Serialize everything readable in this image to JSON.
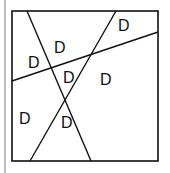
{
  "diagram": {
    "box": {
      "x1": 12,
      "y1": 11,
      "x2": 158,
      "y2": 161
    },
    "lines": [
      {
        "name": "line-a",
        "x1": 27,
        "y1": 11,
        "x2": 91,
        "y2": 161
      },
      {
        "name": "line-b",
        "x1": 116,
        "y1": 11,
        "x2": 30,
        "y2": 161
      },
      {
        "name": "line-c",
        "x1": 12,
        "y1": 81,
        "x2": 158,
        "y2": 32
      }
    ],
    "labels": [
      {
        "text": "D",
        "x": 118,
        "y": 31
      },
      {
        "text": "D",
        "x": 54,
        "y": 53
      },
      {
        "text": "D",
        "x": 28,
        "y": 68
      },
      {
        "text": "D",
        "x": 63,
        "y": 83
      },
      {
        "text": "D",
        "x": 100,
        "y": 85
      },
      {
        "text": "D",
        "x": 19,
        "y": 124
      },
      {
        "text": "D",
        "x": 61,
        "y": 128
      }
    ]
  }
}
